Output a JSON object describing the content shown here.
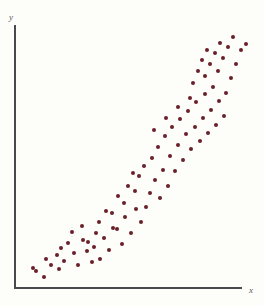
{
  "figure": {
    "background_color": "#fdfdfa",
    "axis_color": "#4a4a4e",
    "point_color": "#6b1f28",
    "width": 264,
    "height": 306
  },
  "axes": {
    "y_label": "y",
    "x_label": "x"
  },
  "chart_data": {
    "type": "scatter",
    "title": "",
    "subtitle": "",
    "xlabel": "x",
    "ylabel": "y",
    "grid": false,
    "legend": null,
    "annotations": [],
    "xlim": [
      0,
      100
    ],
    "ylim": [
      0,
      100
    ],
    "n_points": 90,
    "marker": {
      "shape": "circle",
      "color": "#6b1f28",
      "size_px": 4.6
    },
    "series": [
      {
        "name": "observations",
        "points": [
          [
            10.5,
            6.8
          ],
          [
            13.6,
            4.4
          ],
          [
            16.2,
            8.2
          ],
          [
            20.7,
            7.6
          ],
          [
            23.4,
            14.6
          ],
          [
            25.2,
            9.0
          ],
          [
            26.8,
            17.0
          ],
          [
            28.4,
            4.9
          ],
          [
            29.7,
            12.1
          ],
          [
            32.0,
            18.9
          ],
          [
            33.5,
            8.5
          ],
          [
            36.1,
            13.2
          ],
          [
            38.0,
            22.7
          ],
          [
            40.4,
            15.9
          ],
          [
            41.8,
            10.6
          ],
          [
            43.2,
            20.1
          ],
          [
            45.0,
            25.9
          ],
          [
            46.5,
            13.8
          ],
          [
            47.9,
            17.8
          ],
          [
            49.4,
            29.4
          ],
          [
            50.8,
            21.2
          ],
          [
            52.3,
            12.9
          ],
          [
            53.7,
            24.7
          ],
          [
            55.1,
            34.0
          ],
          [
            56.4,
            18.2
          ],
          [
            57.8,
            27.3
          ],
          [
            59.2,
            22.0
          ],
          [
            60.5,
            31.8
          ],
          [
            61.9,
            16.4
          ],
          [
            63.2,
            26.1
          ],
          [
            64.6,
            37.2
          ],
          [
            65.9,
            20.8
          ],
          [
            67.3,
            30.5
          ],
          [
            68.6,
            24.2
          ],
          [
            70.0,
            41.0
          ],
          [
            71.3,
            33.6
          ],
          [
            72.6,
            27.9
          ],
          [
            74.0,
            45.4
          ],
          [
            75.3,
            22.6
          ],
          [
            76.6,
            36.8
          ],
          [
            78.0,
            31.2
          ],
          [
            79.3,
            49.5
          ],
          [
            80.6,
            40.2
          ],
          [
            82.0,
            26.4
          ],
          [
            83.3,
            44.8
          ],
          [
            84.6,
            35.1
          ],
          [
            86.0,
            53.8
          ],
          [
            87.3,
            29.7
          ],
          [
            88.6,
            47.6
          ],
          [
            90.0,
            38.9
          ],
          [
            91.3,
            57.4
          ],
          [
            92.6,
            43.3
          ],
          [
            94.0,
            51.0
          ],
          [
            95.3,
            33.7
          ],
          [
            96.6,
            60.2
          ],
          [
            98.0,
            46.1
          ],
          [
            99.3,
            55.0
          ],
          [
            100.6,
            39.4
          ],
          [
            102.0,
            64.8
          ],
          [
            103.3,
            50.6
          ],
          [
            104.6,
            58.3
          ],
          [
            106.0,
            44.0
          ],
          [
            107.3,
            69.5
          ],
          [
            108.6,
            54.2
          ],
          [
            110.0,
            62.0
          ],
          [
            111.3,
            48.1
          ],
          [
            112.6,
            73.8
          ],
          [
            114.0,
            58.6
          ],
          [
            115.3,
            66.4
          ],
          [
            116.6,
            52.2
          ],
          [
            118.0,
            78.1
          ],
          [
            119.3,
            63.0
          ],
          [
            120.6,
            70.7
          ],
          [
            122.0,
            56.5
          ],
          [
            123.3,
            82.4
          ],
          [
            124.6,
            67.3
          ],
          [
            126.0,
            75.1
          ],
          [
            127.3,
            60.9
          ],
          [
            128.6,
            86.8
          ],
          [
            130.0,
            71.6
          ],
          [
            131.3,
            79.4
          ],
          [
            132.6,
            65.2
          ],
          [
            134.0,
            91.1
          ],
          [
            135.3,
            76.0
          ],
          [
            136.6,
            83.7
          ],
          [
            138.0,
            69.5
          ],
          [
            139.3,
            95.5
          ],
          [
            140.6,
            80.3
          ],
          [
            142.0,
            88.0
          ],
          [
            143.3,
            73.8
          ]
        ]
      }
    ],
    "pixel_points": [
      [
        36,
        271
      ],
      [
        44,
        277
      ],
      [
        51,
        265
      ],
      [
        59,
        269
      ],
      [
        33,
        268
      ],
      [
        46,
        259
      ],
      [
        57,
        255
      ],
      [
        64,
        261
      ],
      [
        68,
        243
      ],
      [
        74,
        253
      ],
      [
        78,
        265
      ],
      [
        83,
        240
      ],
      [
        87,
        251
      ],
      [
        92,
        262
      ],
      [
        96,
        233
      ],
      [
        61,
        248
      ],
      [
        72,
        232
      ],
      [
        82,
        226
      ],
      [
        88,
        242
      ],
      [
        94,
        247
      ],
      [
        99,
        222
      ],
      [
        104,
        238
      ],
      [
        109,
        250
      ],
      [
        100,
        259
      ],
      [
        112,
        213
      ],
      [
        117,
        229
      ],
      [
        122,
        244
      ],
      [
        106,
        211
      ],
      [
        118,
        196
      ],
      [
        125,
        217
      ],
      [
        131,
        233
      ],
      [
        136,
        209
      ],
      [
        141,
        222
      ],
      [
        113,
        228
      ],
      [
        124,
        203
      ],
      [
        135,
        191
      ],
      [
        146,
        207
      ],
      [
        128,
        186
      ],
      [
        139,
        176
      ],
      [
        150,
        193
      ],
      [
        155,
        180
      ],
      [
        144,
        166
      ],
      [
        133,
        173
      ],
      [
        160,
        198
      ],
      [
        152,
        158
      ],
      [
        163,
        170
      ],
      [
        168,
        186
      ],
      [
        158,
        147
      ],
      [
        170,
        156
      ],
      [
        175,
        171
      ],
      [
        165,
        136
      ],
      [
        178,
        145
      ],
      [
        183,
        160
      ],
      [
        172,
        127
      ],
      [
        186,
        134
      ],
      [
        191,
        149
      ],
      [
        180,
        119
      ],
      [
        195,
        127
      ],
      [
        200,
        141
      ],
      [
        188,
        111
      ],
      [
        203,
        118
      ],
      [
        208,
        133
      ],
      [
        196,
        102
      ],
      [
        211,
        110
      ],
      [
        216,
        125
      ],
      [
        205,
        94
      ],
      [
        219,
        101
      ],
      [
        224,
        116
      ],
      [
        190,
        98
      ],
      [
        178,
        107
      ],
      [
        166,
        118
      ],
      [
        154,
        130
      ],
      [
        213,
        87
      ],
      [
        226,
        93
      ],
      [
        231,
        78
      ],
      [
        218,
        71
      ],
      [
        205,
        76
      ],
      [
        193,
        83
      ],
      [
        236,
        64
      ],
      [
        223,
        58
      ],
      [
        210,
        64
      ],
      [
        198,
        71
      ],
      [
        241,
        50
      ],
      [
        228,
        47
      ],
      [
        215,
        53
      ],
      [
        202,
        60
      ],
      [
        246,
        44
      ],
      [
        233,
        37
      ],
      [
        220,
        43
      ],
      [
        207,
        50
      ]
    ]
  }
}
